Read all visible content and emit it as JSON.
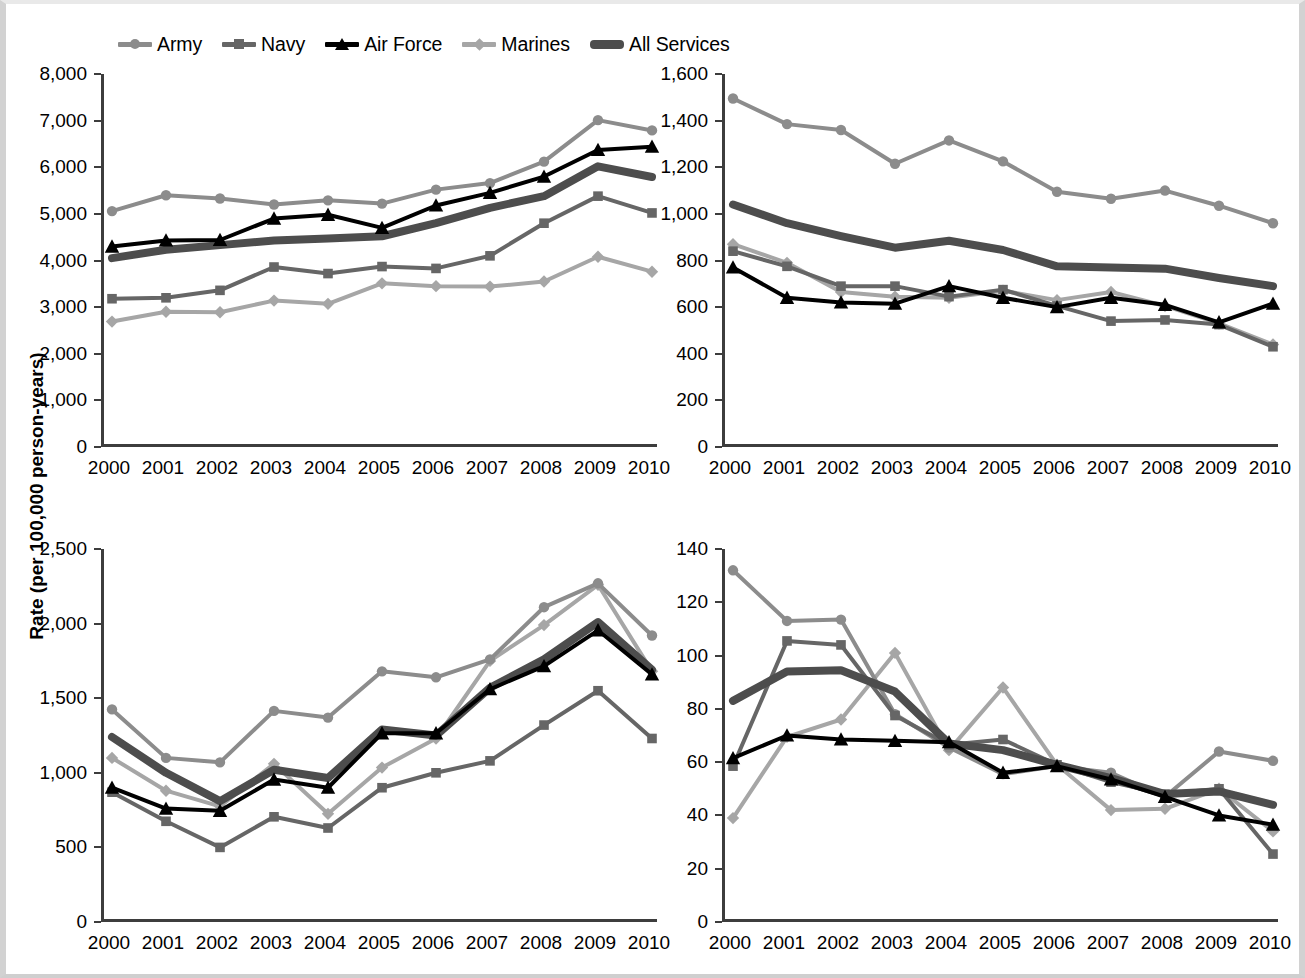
{
  "legend": {
    "items": [
      {
        "label": "Army",
        "marker": "circle",
        "color": "#8c8c8c",
        "width": 4
      },
      {
        "label": "Navy",
        "marker": "square",
        "color": "#666666",
        "width": 4
      },
      {
        "label": "Air Force",
        "marker": "triangle",
        "color": "#000000",
        "width": 4
      },
      {
        "label": "Marines",
        "marker": "diamond",
        "color": "#a6a6a6",
        "width": 4
      },
      {
        "label": "All Services",
        "marker": "none",
        "color": "#4d4d4d",
        "width": 8
      }
    ]
  },
  "axis": {
    "y_title": "Rate (per 100,000 person-years)"
  },
  "chart_data": [
    {
      "id": "respiratory",
      "type": "line",
      "title": "Respiratory Symptoms (ICD-9 786)",
      "xlabel": "",
      "ylabel": "Rate (per 100,000 person-years)",
      "x": [
        2000,
        2001,
        2002,
        2003,
        2004,
        2005,
        2006,
        2007,
        2008,
        2009,
        2010
      ],
      "categories": [
        "2000",
        "2001",
        "2002",
        "2003",
        "2004",
        "2005",
        "2006",
        "2007",
        "2008",
        "2009",
        "2010"
      ],
      "ylim": [
        0,
        8000
      ],
      "yticks": [
        0,
        1000,
        2000,
        3000,
        4000,
        5000,
        6000,
        7000,
        8000
      ],
      "ytick_labels": [
        "0",
        "1,000",
        "2,000",
        "3,000",
        "4,000",
        "5,000",
        "6,000",
        "7,000",
        "8,000"
      ],
      "grid": false,
      "series": [
        {
          "name": "Army",
          "values": [
            5060,
            5400,
            5330,
            5200,
            5290,
            5220,
            5520,
            5660,
            6120,
            7010,
            6790
          ]
        },
        {
          "name": "Navy",
          "values": [
            3180,
            3200,
            3360,
            3860,
            3720,
            3870,
            3830,
            4100,
            4800,
            5380,
            5020
          ]
        },
        {
          "name": "Air Force",
          "values": [
            4300,
            4430,
            4440,
            4900,
            4980,
            4700,
            5180,
            5450,
            5800,
            6370,
            6440
          ]
        },
        {
          "name": "Marines",
          "values": [
            2690,
            2900,
            2890,
            3140,
            3070,
            3510,
            3450,
            3440,
            3550,
            4080,
            3760
          ]
        },
        {
          "name": "All Services",
          "values": [
            4050,
            4230,
            4330,
            4430,
            4470,
            4520,
            4800,
            5130,
            5380,
            6020,
            5790
          ]
        }
      ]
    },
    {
      "id": "asthma",
      "type": "line",
      "title": "Asthma (ICD-9 493)",
      "xlabel": "",
      "ylabel": "Rate (per 100,000 person-years)",
      "x": [
        2000,
        2001,
        2002,
        2003,
        2004,
        2005,
        2006,
        2007,
        2008,
        2009,
        2010
      ],
      "categories": [
        "2000",
        "2001",
        "2002",
        "2003",
        "2004",
        "2005",
        "2006",
        "2007",
        "2008",
        "2009",
        "2010"
      ],
      "ylim": [
        0,
        1600
      ],
      "yticks": [
        0,
        200,
        400,
        600,
        800,
        1000,
        1200,
        1400,
        1600
      ],
      "ytick_labels": [
        "0",
        "200",
        "400",
        "600",
        "800",
        "1,000",
        "1,200",
        "1,400",
        "1,600"
      ],
      "grid": false,
      "series": [
        {
          "name": "Army",
          "values": [
            1495,
            1385,
            1360,
            1215,
            1315,
            1225,
            1095,
            1065,
            1100,
            1035,
            960
          ]
        },
        {
          "name": "Navy",
          "values": [
            840,
            775,
            690,
            690,
            645,
            675,
            605,
            540,
            545,
            525,
            430
          ]
        },
        {
          "name": "Air Force",
          "values": [
            770,
            640,
            620,
            615,
            690,
            640,
            600,
            640,
            610,
            535,
            615
          ]
        },
        {
          "name": "Marines",
          "values": [
            870,
            790,
            665,
            645,
            640,
            670,
            630,
            665,
            605,
            530,
            440
          ]
        },
        {
          "name": "All Services",
          "values": [
            1040,
            960,
            905,
            855,
            885,
            845,
            775,
            770,
            765,
            725,
            690
          ]
        }
      ]
    },
    {
      "id": "bronchitis",
      "type": "line",
      "title": "Unspecified Bronchitis (ICD-9 490)",
      "xlabel": "",
      "ylabel": "Rate (per 100,000 person-years)",
      "x": [
        2000,
        2001,
        2002,
        2003,
        2004,
        2005,
        2006,
        2007,
        2008,
        2009,
        2010
      ],
      "categories": [
        "2000",
        "2001",
        "2002",
        "2003",
        "2004",
        "2005",
        "2006",
        "2007",
        "2008",
        "2009",
        "2010"
      ],
      "ylim": [
        0,
        2500
      ],
      "yticks": [
        0,
        500,
        1000,
        1500,
        2000,
        2500
      ],
      "ytick_labels": [
        "0",
        "500",
        "1,000",
        "1,500",
        "2,000",
        "2,500"
      ],
      "grid": false,
      "series": [
        {
          "name": "Army",
          "values": [
            1425,
            1100,
            1070,
            1415,
            1370,
            1680,
            1640,
            1760,
            2110,
            2270,
            1920
          ]
        },
        {
          "name": "Navy",
          "values": [
            870,
            675,
            500,
            705,
            630,
            900,
            1000,
            1080,
            1320,
            1550,
            1230
          ]
        },
        {
          "name": "Air Force",
          "values": [
            900,
            760,
            745,
            955,
            900,
            1265,
            1265,
            1560,
            1715,
            1955,
            1660
          ]
        },
        {
          "name": "Marines",
          "values": [
            1100,
            880,
            775,
            1060,
            725,
            1035,
            1230,
            1750,
            1990,
            2260,
            1680
          ]
        },
        {
          "name": "All Services",
          "values": [
            1240,
            1000,
            810,
            1020,
            965,
            1290,
            1250,
            1570,
            1760,
            2010,
            1690
          ]
        }
      ]
    },
    {
      "id": "copd",
      "type": "line",
      "title": "COPD (ICD-9 491-492)",
      "xlabel": "",
      "ylabel": "Rate (per 100,000 person-years)",
      "x": [
        2000,
        2001,
        2002,
        2003,
        2004,
        2005,
        2006,
        2007,
        2008,
        2009,
        2010
      ],
      "categories": [
        "2000",
        "2001",
        "2002",
        "2003",
        "2004",
        "2005",
        "2006",
        "2007",
        "2008",
        "2009",
        "2010"
      ],
      "ylim": [
        0,
        140
      ],
      "yticks": [
        0,
        20,
        40,
        60,
        80,
        100,
        120,
        140
      ],
      "ytick_labels": [
        "0",
        "20",
        "40",
        "60",
        "80",
        "100",
        "120",
        "140"
      ],
      "grid": false,
      "series": [
        {
          "name": "Army",
          "values": [
            132,
            113,
            113.5,
            78,
            65.5,
            55.5,
            58.5,
            56,
            47,
            64,
            60.5
          ]
        },
        {
          "name": "Navy",
          "values": [
            58.5,
            105.5,
            104,
            77.5,
            66.5,
            68.5,
            59,
            52.5,
            48,
            50,
            25.5
          ]
        },
        {
          "name": "Air Force",
          "values": [
            61.5,
            70,
            68.5,
            68,
            67.5,
            56,
            58.5,
            53.5,
            47,
            40,
            36.5
          ]
        },
        {
          "name": "Marines",
          "values": [
            39,
            69.5,
            76,
            101,
            64.5,
            88,
            59,
            42,
            42.5,
            50,
            34
          ]
        },
        {
          "name": "All Services",
          "values": [
            83,
            94,
            94.5,
            86.5,
            67,
            64.5,
            59,
            54,
            48,
            49,
            44
          ]
        }
      ]
    }
  ]
}
